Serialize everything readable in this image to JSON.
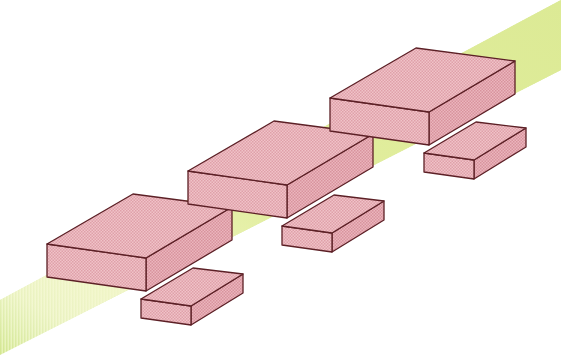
{
  "figure": {
    "type": "isometric-diagram",
    "width": 561,
    "height": 355,
    "background_color": "#ffffff"
  },
  "palette": {
    "slab_top_fill": "#edb8bd",
    "slab_front_fill": "#e8aab2",
    "slab_side_fill": "#e3a3ab",
    "slab_stroke": "#5c2026",
    "band_fill": "#d8e89a",
    "band_fill_soft": "#e9f2bb",
    "band_fade": "#fbfbe4",
    "hatch_color": "#d38f99",
    "white": "#ffffff"
  },
  "band": {
    "name": "inclined-band",
    "label": "diagonal band",
    "direction": "lower-left to upper-right",
    "thickness_px": 78,
    "fade_end": "lower-left"
  },
  "blocks": [
    {
      "id": "block-1",
      "label": "Thick slab 1 (lower left)",
      "kind": "thick-slab",
      "top_face": [
        [
          47,
          244
        ],
        [
          133,
          194
        ],
        [
          232,
          207
        ],
        [
          146,
          258
        ]
      ],
      "front_face": [
        [
          47,
          244
        ],
        [
          146,
          258
        ],
        [
          146,
          291
        ],
        [
          47,
          277
        ]
      ],
      "side_face": [
        [
          146,
          258
        ],
        [
          232,
          207
        ],
        [
          232,
          240
        ],
        [
          146,
          291
        ]
      ]
    },
    {
      "id": "slab-1",
      "label": "Thin slab 1 (lower left)",
      "kind": "thin-slab",
      "top_face": [
        [
          141,
          299
        ],
        [
          193,
          268
        ],
        [
          243,
          274
        ],
        [
          191,
          306
        ]
      ],
      "front_face": [
        [
          141,
          299
        ],
        [
          191,
          306
        ],
        [
          191,
          325
        ],
        [
          141,
          318
        ]
      ],
      "side_face": [
        [
          191,
          306
        ],
        [
          243,
          274
        ],
        [
          243,
          293
        ],
        [
          191,
          325
        ]
      ]
    },
    {
      "id": "block-2",
      "label": "Thick slab 2 (middle)",
      "kind": "thick-slab",
      "top_face": [
        [
          188,
          171
        ],
        [
          274,
          121
        ],
        [
          373,
          134
        ],
        [
          287,
          185
        ]
      ],
      "front_face": [
        [
          188,
          171
        ],
        [
          287,
          185
        ],
        [
          287,
          218
        ],
        [
          188,
          204
        ]
      ],
      "side_face": [
        [
          287,
          185
        ],
        [
          373,
          134
        ],
        [
          373,
          167
        ],
        [
          287,
          218
        ]
      ]
    },
    {
      "id": "slab-2",
      "label": "Thin slab 2 (middle)",
      "kind": "thin-slab",
      "top_face": [
        [
          282,
          226
        ],
        [
          334,
          195
        ],
        [
          384,
          201
        ],
        [
          332,
          233
        ]
      ],
      "front_face": [
        [
          282,
          226
        ],
        [
          332,
          233
        ],
        [
          332,
          252
        ],
        [
          282,
          245
        ]
      ],
      "side_face": [
        [
          332,
          233
        ],
        [
          384,
          201
        ],
        [
          384,
          220
        ],
        [
          332,
          252
        ]
      ]
    },
    {
      "id": "block-3",
      "label": "Thick slab 3 (upper right)",
      "kind": "thick-slab",
      "top_face": [
        [
          330,
          98
        ],
        [
          416,
          48
        ],
        [
          515,
          61
        ],
        [
          429,
          112
        ]
      ],
      "front_face": [
        [
          330,
          98
        ],
        [
          429,
          112
        ],
        [
          429,
          145
        ],
        [
          330,
          131
        ]
      ],
      "side_face": [
        [
          429,
          112
        ],
        [
          515,
          61
        ],
        [
          515,
          94
        ],
        [
          429,
          145
        ]
      ]
    },
    {
      "id": "slab-3",
      "label": "Thin slab 3 (upper right)",
      "kind": "thin-slab",
      "top_face": [
        [
          424,
          153
        ],
        [
          476,
          122
        ],
        [
          526,
          128
        ],
        [
          474,
          160
        ]
      ],
      "front_face": [
        [
          424,
          153
        ],
        [
          474,
          160
        ],
        [
          474,
          179
        ],
        [
          424,
          172
        ]
      ],
      "side_face": [
        [
          474,
          160
        ],
        [
          526,
          128
        ],
        [
          526,
          147
        ],
        [
          474,
          179
        ]
      ]
    }
  ],
  "counts": {
    "thick_slabs": 3,
    "thin_slabs": 3,
    "bands": 1
  }
}
